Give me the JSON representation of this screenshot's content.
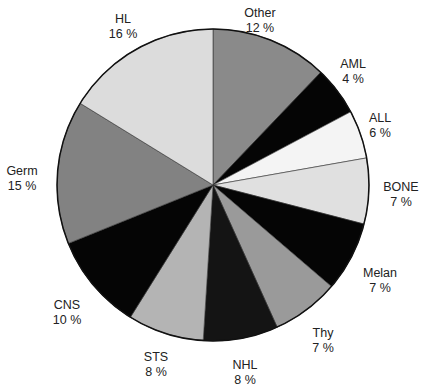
{
  "chart_data": {
    "type": "pie",
    "title": "",
    "start_angle_deg": 0,
    "direction": "clockwise",
    "legend": "none",
    "center": [
      213,
      185
    ],
    "radius": 156,
    "slices": [
      {
        "name": "Other",
        "value": 12,
        "pct_label": "12%",
        "start": 0,
        "end": 43.7,
        "color": "#8a8a8a",
        "label_pos": [
          260,
          6
        ]
      },
      {
        "name": "AML",
        "value": 4,
        "pct_label": "4%",
        "start": 43.7,
        "end": 62,
        "color": "#050505",
        "label_pos": [
          353,
          57
        ]
      },
      {
        "name": "ALL",
        "value": 6,
        "pct_label": "6%",
        "start": 62,
        "end": 80,
        "color": "#f4f4f4",
        "label_pos": [
          380,
          111
        ]
      },
      {
        "name": "BONE",
        "value": 7,
        "pct_label": "7%",
        "start": 80,
        "end": 104.5,
        "color": "#e0e0e0",
        "label_pos": [
          401,
          180
        ]
      },
      {
        "name": "Melan",
        "value": 7,
        "pct_label": "7%",
        "start": 104.5,
        "end": 130.6,
        "color": "#050505",
        "label_pos": [
          380,
          266
        ]
      },
      {
        "name": "Thy",
        "value": 7,
        "pct_label": "7%",
        "start": 130.6,
        "end": 155.7,
        "color": "#9a9a9a",
        "label_pos": [
          323,
          326
        ]
      },
      {
        "name": "NHL",
        "value": 8,
        "pct_label": "8%",
        "start": 155.7,
        "end": 183.6,
        "color": "#141414",
        "label_pos": [
          245,
          358
        ]
      },
      {
        "name": "STS",
        "value": 8,
        "pct_label": "8%",
        "start": 183.6,
        "end": 212,
        "color": "#b4b4b4",
        "label_pos": [
          156,
          350
        ]
      },
      {
        "name": "CNS",
        "value": 10,
        "pct_label": "10%",
        "start": 212,
        "end": 248,
        "color": "#050505",
        "label_pos": [
          67,
          298
        ]
      },
      {
        "name": "Germ",
        "value": 15,
        "pct_label": "15%",
        "start": 248,
        "end": 301.6,
        "color": "#828282",
        "label_pos": [
          22,
          164
        ]
      },
      {
        "name": "HL",
        "value": 16,
        "pct_label": "16%",
        "start": 301.6,
        "end": 360,
        "color": "#dcdcdc",
        "label_pos": [
          123,
          12
        ]
      }
    ]
  }
}
